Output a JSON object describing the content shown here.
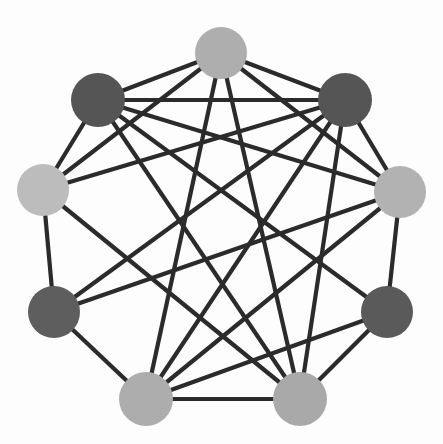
{
  "figure": {
    "type": "network-graph",
    "title": "",
    "background_color": "#fdfdfd",
    "width": 443,
    "height": 444
  },
  "chart_data": {
    "type": "scatter",
    "title": "",
    "subtitle": "",
    "xlabel": "",
    "ylabel": "",
    "grid": false,
    "legend": "none",
    "graph_kind": "undirected node-link diagram",
    "layout": "circular",
    "node_count": 9,
    "edge_count": 25,
    "node_radius": 26,
    "edge_color": "#2b2b2b",
    "edge_width": 4.2,
    "palette": {
      "dark": "#565656",
      "medium": "#ababab",
      "light": "#bcbcbc"
    },
    "nodes": [
      {
        "id": 0,
        "name": "top",
        "x": 221,
        "y": 53,
        "r": 26,
        "color": "#aeaeae",
        "shade": "medium",
        "degree": 6
      },
      {
        "id": 1,
        "name": "upper-right",
        "x": 345,
        "y": 100,
        "r": 27,
        "color": "#555555",
        "shade": "dark",
        "degree": 7
      },
      {
        "id": 2,
        "name": "right",
        "x": 400,
        "y": 192,
        "r": 26,
        "color": "#b2b2b2",
        "shade": "medium",
        "degree": 6
      },
      {
        "id": 3,
        "name": "lower-right",
        "x": 387,
        "y": 312,
        "r": 26,
        "color": "#5a5a5a",
        "shade": "dark",
        "degree": 5
      },
      {
        "id": 4,
        "name": "bottom-right",
        "x": 300,
        "y": 399,
        "r": 27,
        "color": "#a9a9a9",
        "shade": "medium",
        "degree": 6
      },
      {
        "id": 5,
        "name": "bottom-left",
        "x": 146,
        "y": 399,
        "r": 27,
        "color": "#adadad",
        "shade": "medium",
        "degree": 7
      },
      {
        "id": 6,
        "name": "lower-left",
        "x": 54,
        "y": 312,
        "r": 26,
        "color": "#5e5e5e",
        "shade": "dark",
        "degree": 5
      },
      {
        "id": 7,
        "name": "left",
        "x": 43,
        "y": 190,
        "r": 26,
        "color": "#bcbcbc",
        "shade": "light",
        "degree": 6
      },
      {
        "id": 8,
        "name": "upper-left",
        "x": 98,
        "y": 100,
        "r": 27,
        "color": "#555555",
        "shade": "dark",
        "degree": 7
      }
    ],
    "edges": [
      {
        "source": 0,
        "target": 8
      },
      {
        "source": 0,
        "target": 1
      },
      {
        "source": 0,
        "target": 7
      },
      {
        "source": 0,
        "target": 2
      },
      {
        "source": 0,
        "target": 5
      },
      {
        "source": 0,
        "target": 4
      },
      {
        "source": 1,
        "target": 2
      },
      {
        "source": 1,
        "target": 8
      },
      {
        "source": 1,
        "target": 7
      },
      {
        "source": 1,
        "target": 6
      },
      {
        "source": 1,
        "target": 5
      },
      {
        "source": 1,
        "target": 4
      },
      {
        "source": 2,
        "target": 3
      },
      {
        "source": 2,
        "target": 8
      },
      {
        "source": 2,
        "target": 6
      },
      {
        "source": 2,
        "target": 5
      },
      {
        "source": 3,
        "target": 4
      },
      {
        "source": 3,
        "target": 8
      },
      {
        "source": 3,
        "target": 5
      },
      {
        "source": 4,
        "target": 5
      },
      {
        "source": 4,
        "target": 8
      },
      {
        "source": 4,
        "target": 7
      },
      {
        "source": 5,
        "target": 6
      },
      {
        "source": 6,
        "target": 7
      },
      {
        "source": 7,
        "target": 8
      }
    ]
  }
}
